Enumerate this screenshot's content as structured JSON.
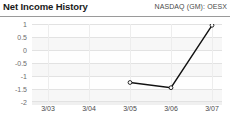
{
  "header": {
    "title": "Net Income History",
    "ticker": "NASDAQ (GM): OESX"
  },
  "colors": {
    "line": "#111111",
    "marker_fill": "#ffffff",
    "marker_stroke": "#111111",
    "plot_background": "#f7f7f7",
    "gridline": "#e2e2e2",
    "axis_text": "#6d6d6d",
    "title_text": "#1a1a1a",
    "rule": "#9a9a9a"
  },
  "chart_data": {
    "type": "line",
    "title": "Net Income History",
    "subtitle": "NASDAQ (GM): OESX",
    "xlabel": "",
    "ylabel": "",
    "categories": [
      "3/03",
      "3/04",
      "3/05",
      "3/06",
      "3/07"
    ],
    "x": [
      "3/03",
      "3/04",
      "3/05",
      "3/06",
      "3/07"
    ],
    "values": [
      null,
      null,
      -1.25,
      -1.45,
      0.95
    ],
    "series": [
      {
        "name": "Net Income",
        "values": [
          null,
          null,
          -1.25,
          -1.45,
          0.95
        ]
      }
    ],
    "ylim": [
      -2,
      1
    ],
    "yticks": [
      1,
      0.5,
      0,
      -0.5,
      -1,
      -1.5,
      -2
    ],
    "ytick_labels": [
      "1",
      "0.5",
      "0",
      "-0.5",
      "-1",
      "-1.5",
      "-2"
    ],
    "xtick_labels": [
      "3/03",
      "3/04",
      "3/05",
      "3/06",
      "3/07"
    ],
    "grid": true,
    "grid_axis": "y",
    "legend": false,
    "legend_position": "none",
    "markers": "open-circle"
  }
}
